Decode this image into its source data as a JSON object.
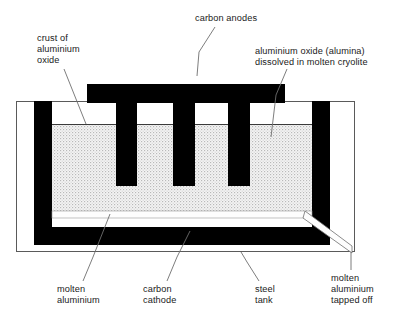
{
  "diagram": {
    "labels": [
      {
        "id": "carbon-anodes",
        "text": "carbon anodes",
        "x": 195,
        "y": 13,
        "align": "left"
      },
      {
        "id": "crust",
        "text": "crust of\naluminium\noxide",
        "x": 37,
        "y": 33,
        "align": "left"
      },
      {
        "id": "alumina-cryolite",
        "text": "aluminium oxide (alumina)\ndissolved in molten cryolite",
        "x": 255,
        "y": 46,
        "align": "left"
      },
      {
        "id": "molten-aluminium",
        "text": "molten\naluminium",
        "x": 57,
        "y": 284,
        "align": "left"
      },
      {
        "id": "carbon-cathode",
        "text": "carbon\ncathode",
        "x": 143,
        "y": 284,
        "align": "left"
      },
      {
        "id": "steel-tank",
        "text": "steel\ntank",
        "x": 255,
        "y": 284,
        "align": "left"
      },
      {
        "id": "tapped-off",
        "text": "molten\naluminium\ntapped off",
        "x": 331,
        "y": 273,
        "align": "left"
      }
    ],
    "colors": {
      "carbon": "#000000",
      "electrolyte_fill": "#f2f2f2",
      "electrolyte_dot": "#b9b9b9",
      "molten_aluminium": "#fbfbfb",
      "tank_outline": "#5a5a5a",
      "leader_line": "#6e6e6e",
      "text": "#1a1a1a",
      "background": "#ffffff"
    },
    "geometry": {
      "steel_tank": {
        "x": 16,
        "y": 101,
        "width": 339,
        "height": 151
      },
      "cathode_outer": {
        "x": 34,
        "y": 101,
        "width": 296,
        "height": 144
      },
      "cathode_wall_thickness": 18,
      "electrolyte": {
        "x": 52,
        "y": 124,
        "width": 260,
        "height": 87
      },
      "molten_layer": {
        "x": 52,
        "y": 211,
        "width": 260,
        "height": 7
      },
      "anode_bar": {
        "x": 87,
        "y": 84,
        "width": 198,
        "height": 19
      },
      "anode_legs": [
        {
          "x": 116,
          "y": 103,
          "width": 21,
          "height": 83
        },
        {
          "x": 173,
          "y": 103,
          "width": 22,
          "height": 83
        },
        {
          "x": 228,
          "y": 103,
          "width": 22,
          "height": 83
        }
      ],
      "tap_spout": {
        "from_x": 312,
        "from_y": 211,
        "to_x": 352,
        "to_y": 250
      }
    },
    "leaders": [
      {
        "id": "leader-carbon-anodes",
        "points": "215,26 200,50 197,74"
      },
      {
        "id": "leader-crust",
        "points": "65,70 85,124"
      },
      {
        "id": "leader-alumina",
        "points": "286,70 275,96 271,137"
      },
      {
        "id": "leader-molten-aluminium",
        "points": "82,281 92,258 110,214"
      },
      {
        "id": "leader-carbon-cathode",
        "points": "166,281 176,258 190,228"
      },
      {
        "id": "leader-steel-tank",
        "points": "258,281 246,262 240,252"
      },
      {
        "id": "leader-tapped-off",
        "points": "351,270 351,254"
      }
    ]
  }
}
